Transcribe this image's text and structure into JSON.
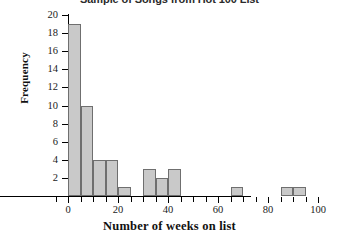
{
  "chart_data": {
    "type": "bar",
    "title": "Sample of Songs from Hot 100 List",
    "xlabel": "Number of weeks on list",
    "ylabel": "Frequency",
    "xlim": [
      -5,
      102
    ],
    "ylim": [
      0,
      20
    ],
    "grid": false,
    "legend": null,
    "bin_width": 5,
    "categories": [
      "0-5",
      "5-10",
      "10-15",
      "15-20",
      "20-25",
      "25-30",
      "30-35",
      "35-40",
      "40-45",
      "45-50",
      "50-55",
      "55-60",
      "60-65",
      "65-70",
      "70-75",
      "75-80",
      "80-85",
      "85-90",
      "90-95",
      "95-100"
    ],
    "bins": [
      {
        "start": 0,
        "end": 5,
        "value": 19
      },
      {
        "start": 5,
        "end": 10,
        "value": 10
      },
      {
        "start": 10,
        "end": 15,
        "value": 4
      },
      {
        "start": 15,
        "end": 20,
        "value": 4
      },
      {
        "start": 20,
        "end": 25,
        "value": 1
      },
      {
        "start": 25,
        "end": 30,
        "value": 0
      },
      {
        "start": 30,
        "end": 35,
        "value": 3
      },
      {
        "start": 35,
        "end": 40,
        "value": 2
      },
      {
        "start": 40,
        "end": 45,
        "value": 3
      },
      {
        "start": 45,
        "end": 50,
        "value": 0
      },
      {
        "start": 50,
        "end": 55,
        "value": 0
      },
      {
        "start": 55,
        "end": 60,
        "value": 0
      },
      {
        "start": 60,
        "end": 65,
        "value": 0
      },
      {
        "start": 65,
        "end": 70,
        "value": 1
      },
      {
        "start": 70,
        "end": 75,
        "value": 0
      },
      {
        "start": 75,
        "end": 80,
        "value": 0
      },
      {
        "start": 80,
        "end": 85,
        "value": 0
      },
      {
        "start": 85,
        "end": 90,
        "value": 1
      },
      {
        "start": 90,
        "end": 95,
        "value": 1
      },
      {
        "start": 95,
        "end": 100,
        "value": 0
      }
    ],
    "values": [
      19,
      10,
      4,
      4,
      1,
      0,
      3,
      2,
      3,
      0,
      0,
      0,
      0,
      1,
      0,
      0,
      0,
      1,
      1,
      0
    ],
    "y_ticks": [
      2,
      4,
      6,
      8,
      10,
      12,
      14,
      16,
      18,
      20
    ],
    "x_ticks_major": [
      0,
      20,
      40,
      60,
      80,
      100
    ],
    "x_ticks_minor": [
      -5,
      5,
      10,
      15,
      25,
      30,
      35,
      45,
      50,
      55,
      65,
      70,
      75,
      85,
      90,
      95
    ],
    "colors": {
      "bar_fill": "#c9c9c9",
      "bar_stroke": "#6f6f6f",
      "axis": "#000000",
      "text": "#1a1a1a",
      "background": "#ffffff"
    }
  }
}
